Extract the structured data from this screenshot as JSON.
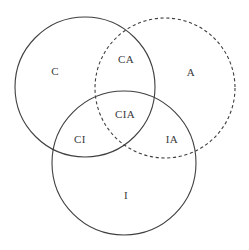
{
  "diagram": {
    "background_color": "#ffffff",
    "stroke_color": "#3f3f3f",
    "label_color": "#3a3a3a",
    "circles": [
      {
        "id": "circle-c",
        "set_label": "C",
        "style": "solid",
        "cx": 85,
        "cy": 87,
        "r": 70
      },
      {
        "id": "circle-a",
        "set_label": "A",
        "style": "dashed",
        "cx": 165,
        "cy": 88,
        "r": 70
      },
      {
        "id": "circle-i",
        "set_label": "I",
        "style": "solid",
        "cx": 124,
        "cy": 163,
        "r": 72
      }
    ],
    "labels": [
      {
        "id": "label-c",
        "text": "C",
        "x": 55,
        "y": 72
      },
      {
        "id": "label-ca",
        "text": "CA",
        "x": 126,
        "y": 60
      },
      {
        "id": "label-a",
        "text": "A",
        "x": 191,
        "y": 73
      },
      {
        "id": "label-ci",
        "text": "CI",
        "x": 80,
        "y": 140
      },
      {
        "id": "label-cia",
        "text": "CIA",
        "x": 125,
        "y": 115
      },
      {
        "id": "label-ia",
        "text": "IA",
        "x": 172,
        "y": 140
      },
      {
        "id": "label-i",
        "text": "I",
        "x": 126,
        "y": 196
      }
    ]
  }
}
